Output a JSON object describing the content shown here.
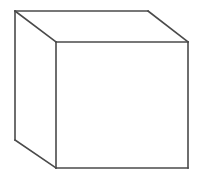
{
  "figure": {
    "shape_name": "cube",
    "projection": "oblique / cabinet-style parallel projection",
    "background_color": "#ffffff",
    "stroke_color": "#4a4a4a",
    "stroke_color_dark": "#3c3c3c",
    "fill_color": "#ffffff",
    "stroke_width": 1.6,
    "canvas": {
      "width": 204,
      "height": 190
    },
    "vertices": {
      "front_top_left": {
        "x": 56,
        "y": 42
      },
      "front_top_right": {
        "x": 188,
        "y": 42
      },
      "front_bottom_right": {
        "x": 188,
        "y": 168
      },
      "front_bottom_left": {
        "x": 56,
        "y": 168
      },
      "back_top_left": {
        "x": 15,
        "y": 11
      },
      "back_top_right": {
        "x": 148,
        "y": 11
      },
      "back_bottom_left": {
        "x": 15,
        "y": 140
      }
    },
    "faces": {
      "front": "56,42 188,42 188,168 56,168",
      "top": "15,11 148,11 188,42 56,42",
      "left": "15,11 56,42 56,168 15,140"
    },
    "edges": [
      {
        "name": "front-top",
        "x1": 56,
        "y1": 42,
        "x2": 188,
        "y2": 42
      },
      {
        "name": "front-right",
        "x1": 188,
        "y1": 42,
        "x2": 188,
        "y2": 168
      },
      {
        "name": "front-bottom",
        "x1": 188,
        "y1": 168,
        "x2": 56,
        "y2": 168
      },
      {
        "name": "front-left",
        "x1": 56,
        "y1": 168,
        "x2": 56,
        "y2": 42
      },
      {
        "name": "back-top",
        "x1": 15,
        "y1": 11,
        "x2": 148,
        "y2": 11
      },
      {
        "name": "back-left",
        "x1": 15,
        "y1": 11,
        "x2": 15,
        "y2": 140
      },
      {
        "name": "top-left-diag",
        "x1": 15,
        "y1": 11,
        "x2": 56,
        "y2": 42
      },
      {
        "name": "top-right-diag",
        "x1": 148,
        "y1": 11,
        "x2": 188,
        "y2": 42
      },
      {
        "name": "bottom-left-diag",
        "x1": 15,
        "y1": 140,
        "x2": 56,
        "y2": 168
      }
    ]
  }
}
